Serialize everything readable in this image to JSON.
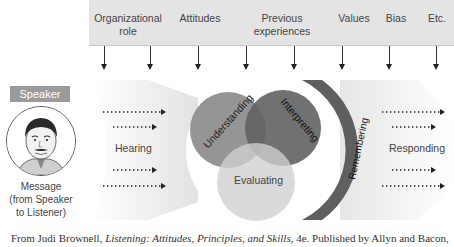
{
  "factors": [
    {
      "label_line1": "Organizational",
      "label_line2": "role",
      "x": 128
    },
    {
      "label_line1": "Attitudes",
      "label_line2": "",
      "x": 200
    },
    {
      "label_line1": "Previous",
      "label_line2": "experiences",
      "x": 282
    },
    {
      "label_line1": "Values",
      "label_line2": "",
      "x": 354
    },
    {
      "label_line1": "Bias",
      "label_line2": "",
      "x": 396
    },
    {
      "label_line1": "Etc.",
      "label_line2": "",
      "x": 437
    }
  ],
  "arrow_positions": [
    104,
    150,
    198,
    246,
    294,
    342,
    389,
    436
  ],
  "speaker": {
    "label": "Speaker",
    "message_line1": "Message",
    "message_line2": "(from Speaker",
    "message_line3": "to Listener)"
  },
  "stages": {
    "hearing": "Hearing",
    "understanding": "Understanding",
    "interpreting": "Interpreting",
    "evaluating": "Evaluating",
    "remembering": "Remembering",
    "responding": "Responding"
  },
  "colors": {
    "topbar": "#e4e4e4",
    "speaker_badge": "#9b9b9b",
    "understanding": "#8a8a8a",
    "interpreting": "#6a6a6a",
    "evaluating": "#c4c4c4",
    "remembering": "#5f5f5f",
    "chevron": "#ebebeb"
  },
  "citation": {
    "prefix": "From Judi Brownell, ",
    "title": "Listening: Attitudes, Principles, and Skills",
    "suffix": ", 4e. Published by Allyn and Bacon,"
  }
}
